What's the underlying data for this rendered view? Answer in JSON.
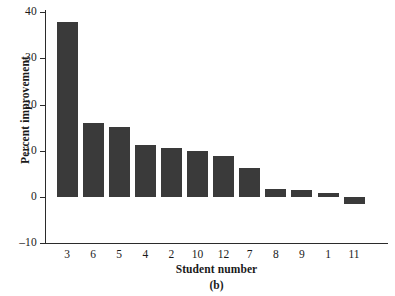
{
  "chart_data": {
    "type": "bar",
    "title": "",
    "subtitle": "",
    "caption": "(b)",
    "xlabel": "Student number",
    "ylabel": "Percent improvement",
    "categories": [
      "3",
      "6",
      "5",
      "4",
      "2",
      "10",
      "12",
      "7",
      "8",
      "9",
      "1",
      "11"
    ],
    "values": [
      37.8,
      16.0,
      15.1,
      11.2,
      10.7,
      9.9,
      8.8,
      6.2,
      1.8,
      1.6,
      0.9,
      -1.5
    ],
    "series": [
      {
        "name": "Percent improvement",
        "values": [
          37.8,
          16.0,
          15.1,
          11.2,
          10.7,
          9.9,
          8.8,
          6.2,
          1.8,
          1.6,
          0.9,
          -1.5
        ]
      }
    ],
    "ylim": [
      -10,
      40
    ],
    "yticks": [
      "-10",
      "0",
      "10",
      "20",
      "30",
      "40"
    ],
    "ytick_values": [
      -10,
      0,
      10,
      20,
      30,
      40
    ],
    "xlim_categories": 12,
    "grid": false,
    "legend": false,
    "legend_position": "none",
    "bar_color": "#3a3a3a",
    "axis_color": "#2b2b2b",
    "background_color": "#ffffff"
  }
}
